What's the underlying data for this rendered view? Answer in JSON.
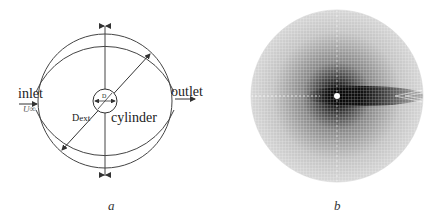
{
  "figure": {
    "panels": [
      {
        "id": "a",
        "caption": "a",
        "labels": {
          "inlet": "inlet",
          "velocity": "U",
          "velocity_sub": "∞",
          "outlet": "outlet",
          "cylinder": "cylinder",
          "diameter_ext": "D",
          "diameter_ext_sub": "ext",
          "diameter": "D"
        }
      },
      {
        "id": "b",
        "caption": "b",
        "description": "radial computational mesh, densest near the cylinder and along the wake"
      }
    ],
    "colors": {
      "line": "#333333",
      "mesh_dark": "#111111",
      "mesh_light": "#cfcfcf"
    }
  }
}
